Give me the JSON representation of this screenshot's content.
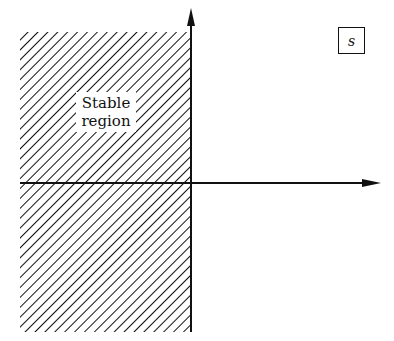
{
  "diagram": {
    "plane_label": "s",
    "region_label_line1": "Stable",
    "region_label_line2": "region",
    "hatched_region": "left half-plane",
    "colors": {
      "ink": "#111111",
      "background": "#ffffff"
    }
  }
}
